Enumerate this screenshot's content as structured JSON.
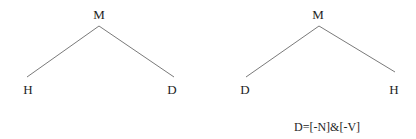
{
  "diagram": {
    "type": "syntax-trees",
    "colors": {
      "background": "#ffffff",
      "edge": "#7a7a7a",
      "text": "#1e1e1e"
    },
    "trees": [
      {
        "id": "tree-left",
        "root": {
          "label": "M",
          "x": 99,
          "y": 8
        },
        "apex": {
          "x": 99,
          "y": 26
        },
        "children": [
          {
            "label": "H",
            "x": 28,
            "y": 83,
            "edge_end": {
              "x": 27,
              "y": 77
            }
          },
          {
            "label": "D",
            "x": 172,
            "y": 83,
            "edge_end": {
              "x": 174,
              "y": 77
            }
          }
        ]
      },
      {
        "id": "tree-right",
        "root": {
          "label": "M",
          "x": 318,
          "y": 8
        },
        "apex": {
          "x": 319,
          "y": 26
        },
        "children": [
          {
            "label": "D",
            "x": 245,
            "y": 83,
            "edge_end": {
              "x": 246,
              "y": 77
            }
          },
          {
            "label": "H",
            "x": 394,
            "y": 83,
            "edge_end": {
              "x": 395,
              "y": 72
            }
          }
        ]
      }
    ],
    "caption": {
      "text": "D=[-N]&[-V]",
      "x": 294,
      "y": 121
    }
  }
}
